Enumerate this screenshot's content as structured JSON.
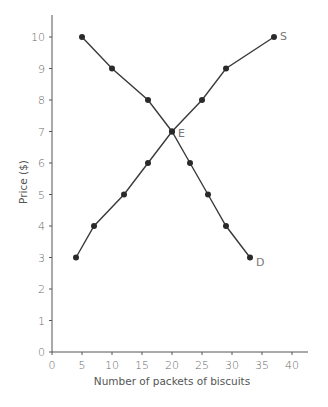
{
  "chart_data": {
    "type": "line",
    "title": "",
    "xlabel": "Number of packets of biscuits",
    "ylabel": "Price ($)",
    "xlim": [
      0,
      40
    ],
    "ylim": [
      0,
      10
    ],
    "x_ticks": [
      0,
      5,
      10,
      15,
      20,
      25,
      30,
      35,
      40
    ],
    "y_ticks": [
      0,
      1,
      2,
      3,
      4,
      5,
      6,
      7,
      8,
      9,
      10
    ],
    "grid": false,
    "legend": "none (curves labeled directly at ends)",
    "series": [
      {
        "name": "D",
        "label": "D",
        "description": "Demand",
        "points": [
          [
            5,
            10
          ],
          [
            10,
            9
          ],
          [
            16,
            8
          ],
          [
            20,
            7
          ],
          [
            23,
            6
          ],
          [
            26,
            5
          ],
          [
            29,
            4
          ],
          [
            33,
            3
          ]
        ]
      },
      {
        "name": "S",
        "label": "S",
        "description": "Supply",
        "points": [
          [
            4,
            3
          ],
          [
            7,
            4
          ],
          [
            12,
            5
          ],
          [
            16,
            6
          ],
          [
            20,
            7
          ],
          [
            25,
            8
          ],
          [
            29,
            9
          ],
          [
            37,
            10
          ]
        ]
      }
    ],
    "annotations": [
      {
        "text": "E",
        "x": 20,
        "y": 7,
        "description": "Equilibrium point"
      },
      {
        "text": "S",
        "x": 37,
        "y": 10
      },
      {
        "text": "D",
        "x": 33,
        "y": 3
      }
    ]
  },
  "style": {
    "line_color": "#3a3a3a",
    "marker_color": "#2a2a2a",
    "axis_color": "#555555",
    "text_color": "#666666"
  }
}
